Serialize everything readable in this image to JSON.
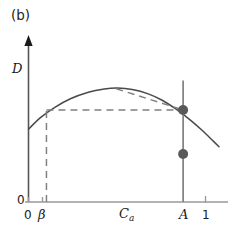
{
  "figure": {
    "panel_label": "(b)",
    "background_color": "#ffffff",
    "width": 242,
    "height": 232
  },
  "axes": {
    "y": {
      "title": "D",
      "origin_label": "0",
      "arrow": true,
      "color": "#555555"
    },
    "x": {
      "title": "C",
      "title_subscript": "a",
      "ticks": [
        {
          "name": "x-tick-0",
          "label": "0",
          "value": 0
        },
        {
          "name": "x-tick-beta",
          "label": "β",
          "value": 0.09
        },
        {
          "name": "x-tick-A",
          "label": "A",
          "value": 0.775
        },
        {
          "name": "x-tick-1",
          "label": "1",
          "value": 0.885
        }
      ],
      "color": "#999999"
    }
  },
  "chart_data": {
    "type": "line",
    "title": "(b)",
    "xlabel": "C_a",
    "ylabel": "D",
    "xlim": [
      0,
      1
    ],
    "ylim": [
      0,
      1
    ],
    "grid": false,
    "legend": null,
    "series": [
      {
        "name": "demand-curve",
        "style": "solid",
        "color": "#4a4a4a",
        "points": [
          [
            0.0,
            0.455
          ],
          [
            0.06,
            0.527
          ],
          [
            0.13,
            0.59
          ],
          [
            0.21,
            0.645
          ],
          [
            0.3,
            0.686
          ],
          [
            0.38,
            0.706
          ],
          [
            0.445,
            0.712
          ],
          [
            0.52,
            0.703
          ],
          [
            0.6,
            0.676
          ],
          [
            0.67,
            0.636
          ],
          [
            0.74,
            0.58
          ],
          [
            0.81,
            0.513
          ],
          [
            0.87,
            0.448
          ],
          [
            0.925,
            0.382
          ],
          [
            0.955,
            0.345
          ]
        ]
      },
      {
        "name": "horizontal-dashed-level",
        "style": "dashed",
        "color": "#808080",
        "points": [
          [
            0.09,
            0.575
          ],
          [
            0.775,
            0.575
          ]
        ]
      },
      {
        "name": "vertical-dashed-beta",
        "style": "dashed",
        "color": "#808080",
        "points": [
          [
            0.09,
            0.0
          ],
          [
            0.09,
            0.575
          ]
        ]
      },
      {
        "name": "tangent-dashed-chord",
        "style": "dashed",
        "color": "#808080",
        "points": [
          [
            0.44,
            0.708
          ],
          [
            0.775,
            0.575
          ]
        ]
      },
      {
        "name": "vertical-line-A",
        "style": "solid",
        "color": "#808080",
        "points": [
          [
            0.775,
            0.0
          ],
          [
            0.775,
            0.76
          ]
        ]
      }
    ],
    "markers": [
      {
        "name": "upper-point-at-A",
        "x": 0.775,
        "y": 0.575,
        "color": "#58595b",
        "radius": 5
      },
      {
        "name": "lower-point-at-A",
        "x": 0.775,
        "y": 0.3,
        "color": "#58595b",
        "radius": 5
      }
    ],
    "annotations": [
      {
        "name": "panel-label",
        "text": "(b)",
        "x": 0.03,
        "y": 1.04
      }
    ]
  }
}
